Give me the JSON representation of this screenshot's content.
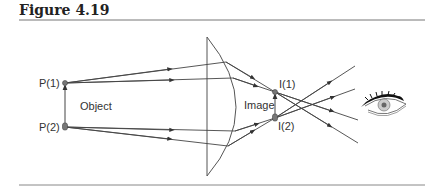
{
  "figure": {
    "title": "Figure 4.19"
  },
  "labels": {
    "p1": "P(1)",
    "p2": "P(2)",
    "object": "Object",
    "image": "Image",
    "i1": "I(1)",
    "i2": "I(2)"
  },
  "icons": {
    "eye": "eye-icon",
    "lens": "plano-convex-lens"
  },
  "colors": {
    "line": "#444444",
    "rule": "#777777",
    "dot": "#777777"
  }
}
